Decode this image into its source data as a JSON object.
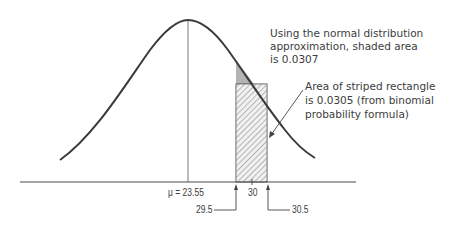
{
  "diagram": {
    "mean_label": "μ = 23.55",
    "center_label": "30",
    "lower_bound_label": "29.5",
    "upper_bound_label": "30.5",
    "annotation_shaded": {
      "line1": "Using the normal distribution",
      "line2": "approximation, shaded area",
      "line3": "is 0.0307"
    },
    "annotation_striped": {
      "line1": "Area of striped rectangle",
      "line2": "is 0.0305 (from binomial",
      "line3": "probability formula)"
    },
    "values": {
      "mean": 23.55,
      "x": 30,
      "lower": 29.5,
      "upper": 30.5,
      "normal_area": 0.0307,
      "binomial_area": 0.0305
    },
    "colors": {
      "curve": "#3a3a3a",
      "shaded": "#b4b4b4",
      "hatch": "#555555",
      "axis": "#4a4a4a"
    }
  }
}
